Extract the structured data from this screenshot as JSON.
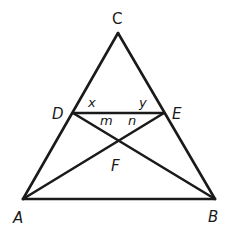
{
  "figure": {
    "type": "geometry-diagram",
    "points": {
      "C": {
        "label": "C",
        "x": 118,
        "y": 33
      },
      "D": {
        "label": "D",
        "x": 73,
        "y": 113
      },
      "E": {
        "label": "E",
        "x": 164,
        "y": 113
      },
      "A": {
        "label": "A",
        "x": 23,
        "y": 199
      },
      "B": {
        "label": "B",
        "x": 215,
        "y": 199
      },
      "F": {
        "label": "F",
        "x": 118,
        "y": 149
      }
    },
    "segments": [
      [
        "C",
        "A"
      ],
      [
        "C",
        "B"
      ],
      [
        "A",
        "B"
      ],
      [
        "D",
        "E"
      ],
      [
        "D",
        "B"
      ],
      [
        "E",
        "A"
      ]
    ],
    "angle_labels": {
      "x": "x",
      "y": "y",
      "m": "m",
      "n": "n"
    }
  }
}
